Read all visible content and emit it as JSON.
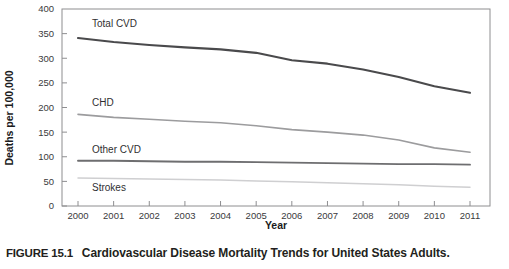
{
  "figure": {
    "tag": "FIGURE 15.1",
    "caption": "Cardiovascular Disease Mortality Trends for United States Adults."
  },
  "chart_data": {
    "type": "line",
    "title": "",
    "xlabel": "Year",
    "ylabel": "Deaths per 100,000",
    "grid": false,
    "legend_position": "inline-labels",
    "xlim": [
      2000,
      2011
    ],
    "ylim": [
      0,
      400
    ],
    "yticks": [
      0,
      50,
      100,
      150,
      200,
      250,
      300,
      350,
      400
    ],
    "ytick_labels": [
      "0",
      "50",
      "100",
      "150",
      "200",
      "250",
      "300",
      "350",
      "400"
    ],
    "x": [
      2000,
      2001,
      2002,
      2003,
      2004,
      2005,
      2006,
      2007,
      2008,
      2009,
      2010,
      2011
    ],
    "xtick_labels": [
      "2000",
      "2001",
      "2002",
      "2003",
      "2004",
      "2005",
      "2006",
      "2007",
      "2008",
      "2009",
      "2010",
      "2011"
    ],
    "series": [
      {
        "name": "Total CVD",
        "color": "#4a4a4c",
        "values": [
          341,
          333,
          327,
          322,
          318,
          311,
          296,
          289,
          277,
          262,
          243,
          230
        ]
      },
      {
        "name": "CHD",
        "color": "#9c9c9e",
        "values": [
          186,
          180,
          176,
          172,
          169,
          163,
          155,
          150,
          144,
          134,
          118,
          109
        ]
      },
      {
        "name": "Other CVD",
        "color": "#6e6e70",
        "values": [
          92,
          92,
          91,
          90,
          90,
          89,
          88,
          87,
          86,
          85,
          85,
          84
        ]
      },
      {
        "name": "Strokes",
        "color": "#cfcfd1",
        "values": [
          57,
          56,
          55,
          54,
          53,
          51,
          49,
          47,
          45,
          43,
          40,
          38
        ]
      }
    ]
  }
}
